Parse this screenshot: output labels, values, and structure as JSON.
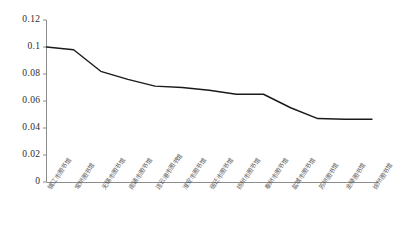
{
  "chart_data": {
    "type": "line",
    "title": "",
    "subtitle": "",
    "xlabel": "",
    "ylabel": "",
    "ylim": [
      0,
      0.12
    ],
    "ytick_labels": [
      "0.12",
      "0.1",
      "0.08",
      "0.06",
      "0.04",
      "0.02",
      "0"
    ],
    "ytick_values": [
      0.12,
      0.1,
      0.08,
      0.06,
      0.04,
      0.02,
      0
    ],
    "grid": false,
    "legend": false,
    "legend_position": "none",
    "line_color": "#1a1a1a",
    "axis_color": "#8c8c8c",
    "categories": [
      "镇江市图书馆",
      "常州图书馆",
      "无锡市图书馆",
      "南通市图书馆",
      "连云港市图书馆",
      "淮安市图书馆",
      "宿迁市图书馆",
      "扬州市图书馆",
      "泰州市图书馆",
      "盐城市图书馆",
      "苏州图书馆",
      "金陵图书馆",
      "徐州图书馆"
    ],
    "values": [
      0.1,
      0.098,
      0.082,
      0.076,
      0.071,
      0.07,
      0.068,
      0.065,
      0.065,
      0.055,
      0.047,
      0.0465,
      0.0465
    ]
  },
  "caption": ""
}
